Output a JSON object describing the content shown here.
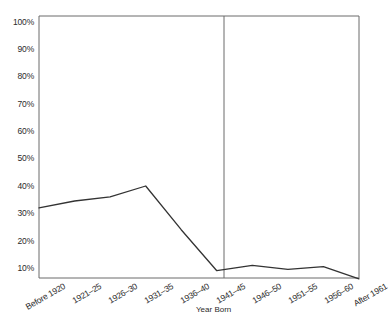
{
  "chart_data": {
    "type": "line",
    "title": "",
    "xlabel": "Year Born",
    "ylabel": "",
    "categories": [
      "Before 1920",
      "1921–25",
      "1926–30",
      "1931–35",
      "1936–40",
      "1941–45",
      "1946–50",
      "1951–55",
      "1956–60",
      "After 1961"
    ],
    "values": [
      32,
      34.5,
      36,
      40,
      24,
      9,
      11,
      9.5,
      10.5,
      6
    ],
    "ytick_labels": [
      "100%",
      "90%",
      "80%",
      "70%",
      "60%",
      "50%",
      "40%",
      "30%",
      "20%",
      "10%"
    ],
    "ytick_values": [
      100,
      90,
      80,
      70,
      60,
      50,
      40,
      30,
      20,
      10
    ],
    "ylim": [
      6,
      100
    ],
    "grid": false,
    "legend": null,
    "annotations": [
      {
        "type": "vertical-divider",
        "at_category": "1941–45"
      }
    ],
    "line_color": "#333333",
    "axis_color": "#6b6b6b"
  },
  "axes": {
    "xlabel": "Year Born"
  }
}
